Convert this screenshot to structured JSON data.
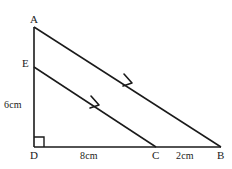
{
  "figure": {
    "kind": "geometry-diagram",
    "stroke_color": "#1a1a1a",
    "background_color": "#ffffff",
    "vertices": [
      {
        "id": "A",
        "label": "A",
        "x": 34,
        "y": 27
      },
      {
        "id": "E",
        "label": "E",
        "x": 34,
        "y": 67
      },
      {
        "id": "D",
        "label": "D",
        "x": 34,
        "y": 147
      },
      {
        "id": "C",
        "label": "C",
        "x": 156,
        "y": 147
      },
      {
        "id": "B",
        "label": "B",
        "x": 221,
        "y": 147
      }
    ],
    "segments": [
      {
        "name": "AD",
        "from": "A",
        "to": "D"
      },
      {
        "name": "DB",
        "from": "D",
        "to": "B"
      },
      {
        "name": "AB",
        "from": "A",
        "to": "B",
        "parallel_mark": true
      },
      {
        "name": "EC",
        "from": "E",
        "to": "C",
        "parallel_mark": true
      }
    ],
    "right_angle": {
      "at": "D",
      "size": 10
    },
    "parallel_arrows": [
      {
        "on": "AB",
        "x": 130,
        "y": 82
      },
      {
        "on": "EC",
        "x": 97,
        "y": 104
      }
    ],
    "measures": {
      "ed": "6cm",
      "dc": "8cm",
      "cb": "2cm"
    },
    "watermark_text": ""
  }
}
